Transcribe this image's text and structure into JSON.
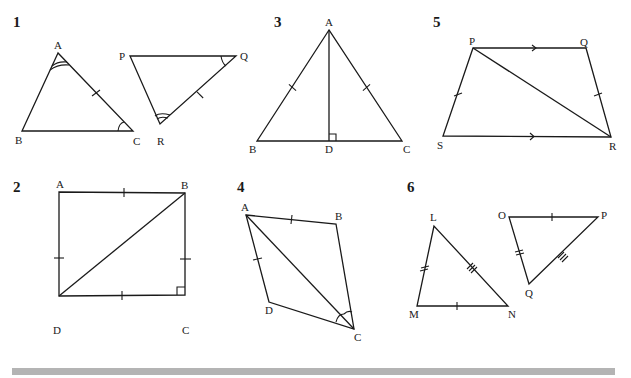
{
  "figures": [
    {
      "number": "1",
      "description": "Two triangles ABC and PQR; angle A equals angle R (double arc), angle C equals angle Q (single arc), AC equals RQ (single tick)",
      "triangle1": {
        "vertices": [
          "A",
          "B",
          "C"
        ]
      },
      "triangle2": {
        "vertices": [
          "P",
          "Q",
          "R"
        ]
      }
    },
    {
      "number": "2",
      "description": "Square ABCD with diagonal DB; all four sides marked with single ticks; right angle at C",
      "vertices": [
        "A",
        "B",
        "C",
        "D"
      ]
    },
    {
      "number": "3",
      "description": "Isosceles triangle ABC with AB = AC (single ticks), altitude AD perpendicular to BC at D",
      "vertices": [
        "A",
        "B",
        "C",
        "D"
      ]
    },
    {
      "number": "4",
      "description": "Quadrilateral ABCD with diagonal AC; AB = AD (single ticks); angles BCA and DCA marked",
      "vertices": [
        "A",
        "B",
        "C",
        "D"
      ]
    },
    {
      "number": "5",
      "description": "Trapezium PQRS with PQ parallel to SR (arrows), PS = QR (single ticks), diagonal PR",
      "vertices": [
        "P",
        "Q",
        "R",
        "S"
      ]
    },
    {
      "number": "6",
      "description": "Triangles LMN and OPQ; MN = OP (single tick), LM = OQ (double tick), LN = PQ (triple tick)",
      "triangle1": {
        "vertices": [
          "L",
          "M",
          "N"
        ]
      },
      "triangle2": {
        "vertices": [
          "O",
          "P",
          "Q"
        ]
      }
    }
  ],
  "labels": {
    "f1": {
      "num": "1",
      "A": "A",
      "B": "B",
      "C": "C",
      "P": "P",
      "Q": "Q",
      "R": "R"
    },
    "f2": {
      "num": "2",
      "A": "A",
      "B": "B",
      "C": "C",
      "D": "D"
    },
    "f3": {
      "num": "3",
      "A": "A",
      "B": "B",
      "C": "C",
      "D": "D"
    },
    "f4": {
      "num": "4",
      "A": "A",
      "B": "B",
      "C": "C",
      "D": "D"
    },
    "f5": {
      "num": "5",
      "P": "P",
      "Q": "Q",
      "R": "R",
      "S": "S"
    },
    "f6": {
      "num": "6",
      "L": "L",
      "M": "M",
      "N": "N",
      "O": "O",
      "P": "P",
      "Q": "Q"
    }
  },
  "colors": {
    "ink": "#1a1a1a",
    "bar": "#b4b4b4",
    "background": "#ffffff"
  }
}
